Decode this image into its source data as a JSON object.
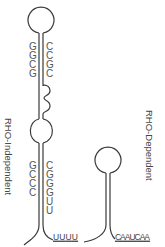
{
  "diagram": {
    "colors": {
      "strand": "#3a3a3a",
      "text": "#555555",
      "background": "#ffffff"
    },
    "independent": {
      "label": "RHO-Independent",
      "upper_stem": {
        "pairs": [
          {
            "left": "G",
            "right": "C"
          },
          {
            "left": "G",
            "right": "C"
          },
          {
            "left": "C",
            "right": "G"
          },
          {
            "left": "G",
            "right": "C"
          }
        ]
      },
      "lower_stem": {
        "pairs": [
          {
            "left": "G",
            "right": "C"
          },
          {
            "left": "C",
            "right": "G"
          },
          {
            "left": "C",
            "right": "G"
          },
          {
            "left": "C",
            "right": "G"
          }
        ],
        "unpaired_right": [
          "U",
          "U"
        ]
      },
      "tail": "UUUU"
    },
    "dependent": {
      "label": "RHO-Dependent",
      "tail": "CAAUCAA"
    }
  }
}
